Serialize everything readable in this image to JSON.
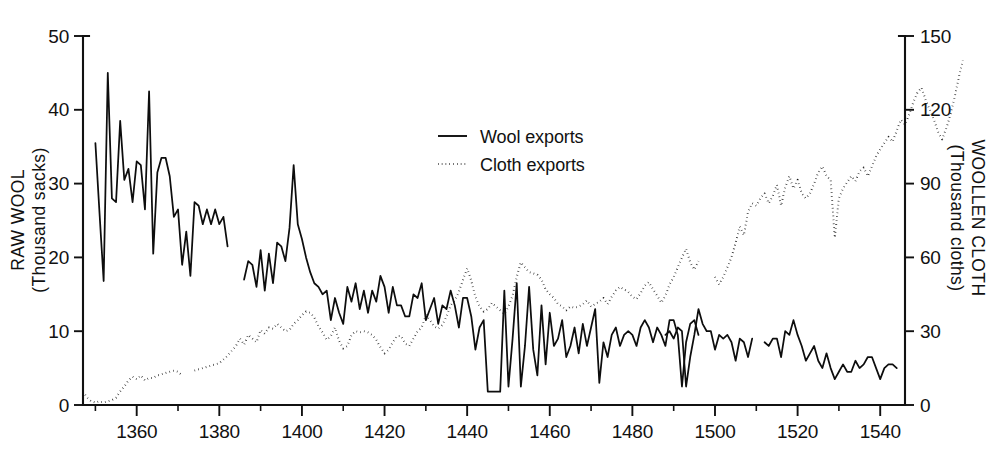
{
  "chart_data": {
    "type": "line",
    "title": "",
    "subtitle": "",
    "xlabel": "",
    "xlim": [
      1347,
      1546
    ],
    "grid": false,
    "legend_position": "upper-center",
    "axes": {
      "left": {
        "label_line1": "RAW WOOL",
        "label_line2": "(Thousand sacks)",
        "ylim": [
          0,
          50
        ],
        "ticks": [
          0,
          10,
          20,
          30,
          40,
          50
        ],
        "ticklabels": [
          "0",
          "10",
          "20",
          "30",
          "40",
          "50"
        ]
      },
      "right": {
        "label_line1": "WOOLLEN CLOTH",
        "label_line2": "(Thousand cloths)",
        "ylim": [
          0,
          150
        ],
        "ticks": [
          0,
          30,
          60,
          90,
          120,
          150
        ],
        "ticklabels": [
          "0",
          "30",
          "60",
          "90",
          "120",
          "150"
        ]
      }
    },
    "x_major_ticks": [
      1360,
      1380,
      1400,
      1420,
      1440,
      1460,
      1480,
      1500,
      1520,
      1540
    ],
    "x_major_ticklabels": [
      "1360",
      "1380",
      "1400",
      "1420",
      "1440",
      "1460",
      "1480",
      "1500",
      "1520",
      "1540"
    ],
    "x_minor_ticks": [
      1350,
      1370,
      1390,
      1410,
      1430,
      1450,
      1470,
      1490,
      1510,
      1530
    ],
    "legend": [
      {
        "label": "Wool exports",
        "style": "solid",
        "axis": "left",
        "color": "#0d0d0d"
      },
      {
        "label": "Cloth exports",
        "style": "dotted",
        "axis": "right",
        "color": "#1a1a1a"
      }
    ],
    "series": [
      {
        "name": "Wool exports",
        "axis": "left",
        "style": "solid",
        "units": "thousand sacks",
        "x_start": 1350,
        "segments": [
          {
            "x_start": 1350,
            "values": [
              35.5,
              26.0,
              16.8,
              45.0,
              28.0,
              27.5,
              38.5,
              30.5,
              32.0,
              27.5,
              33.0,
              32.5,
              26.5,
              42.5,
              20.5,
              31.5,
              33.5,
              33.5,
              31.0,
              25.5,
              26.5,
              19.0,
              23.5,
              17.5,
              27.5,
              27.0,
              24.5,
              26.5,
              24.5,
              26.5,
              24.5,
              25.5,
              21.5
            ]
          },
          {
            "x_start": 1386,
            "values": [
              17.0,
              19.5,
              19.0,
              16.0,
              21.0,
              15.5,
              20.5,
              16.5,
              22.0,
              21.5,
              19.5,
              24.0,
              32.5,
              24.5,
              22.5,
              20.0,
              18.0,
              16.5,
              16.0,
              15.0,
              15.5,
              11.5,
              14.5,
              12.5,
              11.0,
              16.0,
              14.0,
              16.5,
              13.0,
              15.5,
              12.5,
              15.5,
              14.0,
              17.5,
              16.0,
              12.5,
              16.0,
              13.5,
              13.5,
              12.0,
              12.0,
              15.0,
              14.5,
              16.5,
              11.5,
              13.0,
              14.5,
              11.0,
              13.5,
              13.0,
              15.5,
              13.5,
              10.5,
              14.5,
              14.5,
              12.0,
              7.5,
              10.5,
              11.5,
              1.8,
              1.8,
              1.8,
              1.8,
              15.5,
              2.5,
              9.0,
              16.5,
              2.5,
              8.0,
              16.0,
              7.5,
              4.0,
              13.5,
              5.5,
              12.5,
              8.0,
              9.0,
              11.5,
              6.5,
              8.0,
              10.5,
              7.0,
              11.0,
              8.0,
              10.5,
              13.0,
              3.0,
              8.5,
              6.5,
              9.5,
              10.5,
              8.0,
              9.5,
              10.0,
              9.5,
              8.0,
              10.5,
              11.5,
              10.5,
              8.5,
              10.5,
              9.5,
              8.0,
              11.5,
              11.5,
              9.5,
              2.5,
              8.5,
              11.0,
              11.5,
              9.5
            ]
          },
          {
            "x_start": 1488,
            "values": [
              9.5,
              10.0,
              9.0,
              10.5,
              10.0,
              2.5,
              6.5,
              9.5,
              13.0,
              11.0,
              10.0,
              10.0,
              7.5,
              9.5,
              9.0,
              9.5,
              8.5,
              6.0,
              9.0,
              8.5,
              6.5,
              9.0
            ]
          },
          {
            "x_start": 1512,
            "values": [
              8.5,
              8.0,
              9.0,
              9.0,
              6.5,
              10.0,
              9.5,
              11.5,
              9.5,
              8.0,
              6.0,
              7.0,
              8.0,
              6.0,
              5.0,
              7.0,
              5.0,
              3.5,
              4.5,
              5.5,
              4.5,
              4.5,
              6.0,
              5.0,
              5.5,
              6.5,
              6.5,
              5.0,
              3.5,
              5.0,
              5.5,
              5.5,
              5.0
            ]
          }
        ]
      },
      {
        "name": "Cloth exports",
        "axis": "right",
        "style": "dotted",
        "units": "thousand cloths",
        "x_start": 1347,
        "segments": [
          {
            "x_start": 1347,
            "values": [
              5.5,
              3.0,
              1.5,
              1.0,
              1.5,
              1.0,
              1.5,
              2.0,
              3.0,
              5.5,
              7.5,
              10.0,
              11.5,
              10.5,
              12.0,
              10.0,
              11.0,
              11.0,
              12.0,
              12.5,
              13.0,
              13.5,
              14.0,
              13.5,
              12.0
            ]
          },
          {
            "x_start": 1374,
            "values": [
              14.0,
              14.5,
              15.0,
              15.5,
              16.0,
              16.5,
              17.0,
              18.5,
              20.0,
              22.0,
              24.0,
              27.0,
              24.5,
              28.5,
              27.0,
              25.5,
              30.5,
              29.0,
              31.5,
              31.0,
              33.0,
              31.5,
              30.0,
              30.5,
              33.0,
              34.5,
              36.5,
              38.0,
              37.5,
              35.5,
              32.0,
              29.5,
              26.5,
              28.0,
              31.5,
              26.0,
              23.0,
              24.0,
              28.5,
              30.0,
              29.5,
              30.0,
              29.5,
              28.5,
              26.5,
              23.5,
              21.0,
              22.5,
              25.5,
              28.0,
              28.0,
              25.0,
              24.0,
              27.0,
              30.0,
              31.5,
              36.5,
              34.5,
              32.0,
              31.0,
              32.5,
              36.0,
              40.5,
              42.5,
              46.0,
              51.0,
              55.5,
              50.5,
              44.0,
              40.0,
              38.0,
              39.0,
              41.5,
              40.0,
              38.5,
              37.0,
              40.0,
              44.5,
              52.0,
              58.0,
              56.0,
              54.0,
              53.5,
              53.0,
              51.0,
              47.0,
              45.0,
              43.5,
              41.0,
              40.0,
              38.5,
              40.0,
              39.5,
              40.0,
              41.0,
              42.5,
              40.0,
              41.0,
              42.0,
              43.5,
              41.0,
              44.0,
              46.5,
              48.0,
              47.0,
              46.0,
              44.0,
              43.0,
              45.5,
              48.5,
              50.0,
              47.0,
              44.5,
              41.5,
              44.5,
              49.0,
              52.0,
              56.0,
              60.0,
              63.5,
              58.0,
              55.0,
              58.5
            ]
          },
          {
            "x_start": 1500,
            "values": [
              52.0,
              49.0,
              52.0,
              56.0,
              60.0,
              66.0,
              72.5,
              69.0,
              78.5,
              82.0,
              81.0,
              84.0,
              86.0,
              82.0,
              85.0,
              89.5,
              81.0,
              88.5,
              93.0,
              88.0,
              91.5,
              86.0,
              84.0,
              86.0,
              90.0,
              94.5,
              97.0,
              93.0,
              91.5,
              68.0,
              84.0,
              88.0,
              90.5,
              93.0,
              91.0,
              95.0,
              96.5,
              93.0,
              97.0,
              101.0,
              104.0,
              106.5,
              109.0,
              107.0,
              111.5,
              116.0,
              114.0,
              118.0,
              123.0,
              127.0,
              129.0,
              124.0,
              120.0,
              116.0,
              111.0,
              108.0,
              112.5,
              118.0,
              125.0,
              133.0,
              140.0
            ]
          }
        ]
      }
    ]
  },
  "legend_box": {
    "items": [
      {
        "label": "Wool exports"
      },
      {
        "label": "Cloth exports"
      }
    ]
  }
}
